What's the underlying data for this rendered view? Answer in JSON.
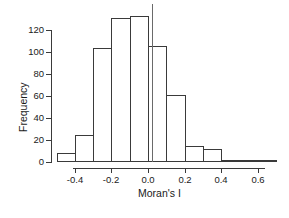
{
  "chart_data": {
    "type": "bar",
    "subtype": "histogram",
    "title": "",
    "xlabel": "Moran's I",
    "ylabel": "Frequency",
    "bin_start": -0.5,
    "bin_width": 0.1,
    "bin_edges": [
      -0.5,
      -0.4,
      -0.3,
      -0.2,
      -0.1,
      0.0,
      0.1,
      0.2,
      0.3,
      0.4,
      0.5,
      0.6,
      0.7
    ],
    "counts": [
      8,
      25,
      104,
      131,
      133,
      105,
      61,
      15,
      12,
      2,
      1,
      2
    ],
    "x_ticks": [
      -0.4,
      -0.2,
      0.0,
      0.2,
      0.4,
      0.6
    ],
    "x_tick_labels": [
      "-0.4",
      "-0.2",
      "0.0",
      "0.2",
      "0.4",
      "0.6"
    ],
    "y_ticks": [
      0,
      20,
      40,
      60,
      80,
      100,
      120
    ],
    "y_tick_labels": [
      "0",
      "20",
      "40",
      "60",
      "80",
      "100",
      "120"
    ],
    "xlim": [
      -0.5,
      0.7
    ],
    "ylim": [
      0,
      133
    ],
    "grid": false,
    "legend": null,
    "reference_line_x": 0.02,
    "bar_fill": "#ffffff",
    "line_color": "#3a3a3a",
    "reference_line_color": "#6a6a6a",
    "background": "#ffffff"
  }
}
